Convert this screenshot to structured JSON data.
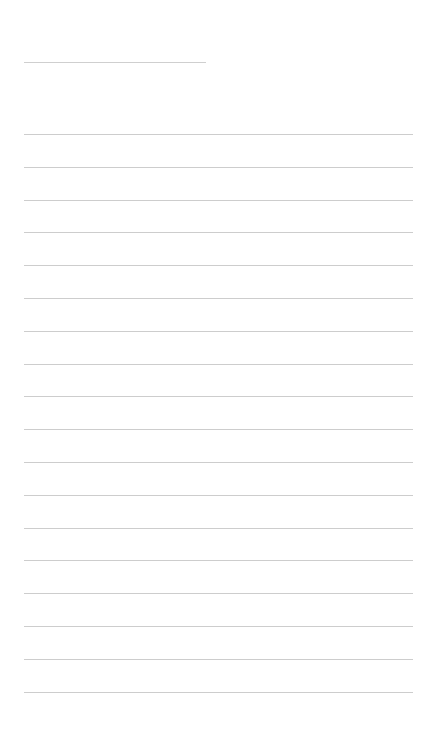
{
  "page": {
    "type": "blank-lined-sheet",
    "title_line": {
      "text": ""
    },
    "ruled_line_count": 18,
    "line_color": "#cdcdcd",
    "background": "#ffffff"
  }
}
